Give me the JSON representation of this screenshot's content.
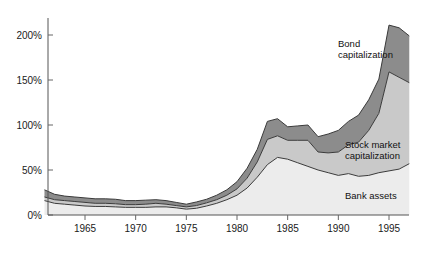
{
  "chart_data": {
    "type": "area",
    "stacked": true,
    "title": "",
    "subtitle": "",
    "xlabel": "",
    "ylabel": "",
    "xlim": [
      1961,
      1997
    ],
    "ylim": [
      0,
      215
    ],
    "grid": false,
    "legend_position": "inline-annotations",
    "y_tick_labels": [
      "0%",
      "50%",
      "100%",
      "150%",
      "200%"
    ],
    "y_tick_values": [
      0,
      50,
      100,
      150,
      200
    ],
    "x_tick_labels": [
      "1965",
      "1970",
      "1975",
      "1980",
      "1985",
      "1990",
      "1995"
    ],
    "x_tick_values": [
      1965,
      1970,
      1975,
      1980,
      1985,
      1990,
      1995
    ],
    "x": [
      1961,
      1962,
      1963,
      1964,
      1965,
      1966,
      1967,
      1968,
      1969,
      1970,
      1971,
      1972,
      1973,
      1974,
      1975,
      1976,
      1977,
      1978,
      1979,
      1980,
      1981,
      1982,
      1983,
      1984,
      1985,
      1986,
      1987,
      1988,
      1989,
      1990,
      1991,
      1992,
      1993,
      1994,
      1995,
      1996,
      1997
    ],
    "series": [
      {
        "name": "Bank assets",
        "color": "#ececec",
        "values": [
          16,
          13,
          12,
          11,
          10,
          9.5,
          9.5,
          9,
          8.5,
          8.5,
          8.5,
          9,
          9,
          8,
          6.5,
          7.5,
          10,
          13,
          17,
          22,
          30,
          42,
          56,
          64,
          62,
          58,
          54,
          50,
          47,
          44,
          46,
          43,
          44,
          47,
          49,
          51,
          57
        ]
      },
      {
        "name": "Stock market capitalization",
        "color": "#c9c9c9",
        "values": [
          4,
          4,
          4,
          4,
          4,
          3.5,
          3.5,
          3.5,
          3,
          3,
          3.5,
          4,
          3,
          2.5,
          2.5,
          3,
          3.5,
          4,
          5,
          7,
          11,
          17,
          28,
          24,
          21,
          25,
          29,
          20,
          22,
          26,
          32,
          38,
          50,
          66,
          110,
          102,
          90
        ]
      },
      {
        "name": "Bond capitalization",
        "color": "#8c8c8c",
        "values": [
          8,
          6,
          5,
          5,
          5,
          5,
          5,
          5,
          4.5,
          4.5,
          4.5,
          4,
          4,
          3.5,
          3,
          4,
          4,
          5,
          6,
          8,
          11,
          14,
          20,
          19,
          15,
          16,
          17,
          17,
          21,
          24,
          26,
          30,
          34,
          38,
          52,
          55,
          52
        ]
      }
    ],
    "totals_note": "Values are percent of GDP; areas are stacked bottom to top: bank assets, stock market capitalization, bond capitalization.",
    "annotations": [
      {
        "name": "bond-capitalization-label",
        "text": "Bond\ncapitalization",
        "line1": "Bond",
        "line2": "capitalization",
        "x_px": 338,
        "y_px": 47
      },
      {
        "name": "stock-market-capitalization-label",
        "text": "Stock market\ncapitalization",
        "line1": "Stock market",
        "line2": "capitalization",
        "x_px": 345,
        "y_px": 148
      },
      {
        "name": "bank-assets-label",
        "text": "Bank assets",
        "line1": "Bank assets",
        "line2": "",
        "x_px": 345,
        "y_px": 199
      }
    ],
    "colors": {
      "bank_assets": "#ececec",
      "stock_market": "#c9c9c9",
      "bond": "#8c8c8c",
      "axis": "#555555",
      "outline": "#3a3a3a",
      "text": "#1a1a1a",
      "background": "#ffffff"
    }
  }
}
